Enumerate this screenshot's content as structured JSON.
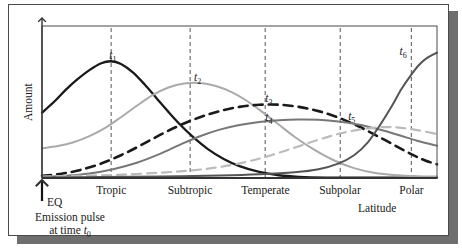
{
  "figure": {
    "y_axis_label": "Amount",
    "x_axis_label": "Latitude",
    "origin_marker": "EQ",
    "caption_line1": "Emission pulse",
    "caption_line2_prefix": "at time ",
    "caption_line2_symbol": "t",
    "caption_line2_subscript": "0"
  },
  "colors": {
    "t1": "#1a1a1a",
    "t2": "#aaaaaa",
    "t3": "#1a1a1a",
    "t4": "#777777",
    "t5": "#bbbbbb",
    "t6": "#555555",
    "axis": "#333333",
    "gridline": "#555555",
    "frame": "#4a4a4a",
    "shadow": "#6e6e6e",
    "background": "#ffffff"
  },
  "zones": [
    {
      "name": "Tropic",
      "x": 0.175
    },
    {
      "name": "Subtropic",
      "x": 0.375
    },
    {
      "name": "Temperate",
      "x": 0.565
    },
    {
      "name": "Subpolar",
      "x": 0.755
    },
    {
      "name": "Polar",
      "x": 0.935
    }
  ],
  "curve_labels": [
    {
      "id": "t1",
      "symbol": "t",
      "subscript": "1"
    },
    {
      "id": "t2",
      "symbol": "t",
      "subscript": "2"
    },
    {
      "id": "t3",
      "symbol": "t",
      "subscript": "3"
    },
    {
      "id": "t4",
      "symbol": "t",
      "subscript": "4"
    },
    {
      "id": "t5",
      "symbol": "t",
      "subscript": "5"
    },
    {
      "id": "t6",
      "symbol": "t",
      "subscript": "6"
    }
  ],
  "chart_data": {
    "type": "line",
    "title": "",
    "xlabel": "Latitude",
    "ylabel": "Amount",
    "xlim": [
      0,
      1
    ],
    "ylim": [
      0,
      1
    ],
    "grid": "vertical-dashed-at-zone-ticks",
    "legend": "inline-curve-labels",
    "x_tick_labels": [
      "Tropic",
      "Subtropic",
      "Temperate",
      "Subpolar",
      "Polar"
    ],
    "x_tick_positions": [
      0.175,
      0.375,
      0.565,
      0.755,
      0.935
    ],
    "y_tick_labels": [],
    "annotations": [
      {
        "text": "EQ",
        "x": 0.0,
        "y": 0.0
      },
      {
        "text": "Emission pulse at time t0",
        "x": 0.0,
        "y": -0.18
      }
    ],
    "series": [
      {
        "name": "t1",
        "style": "solid",
        "color": "#1a1a1a",
        "width": 2.3,
        "label_x": 0.165,
        "label_y": 0.8,
        "peak_x": 0.175,
        "points": [
          [
            0.0,
            0.43
          ],
          [
            0.03,
            0.5
          ],
          [
            0.06,
            0.58
          ],
          [
            0.09,
            0.65
          ],
          [
            0.12,
            0.71
          ],
          [
            0.15,
            0.755
          ],
          [
            0.175,
            0.768
          ],
          [
            0.2,
            0.75
          ],
          [
            0.23,
            0.695
          ],
          [
            0.26,
            0.615
          ],
          [
            0.29,
            0.525
          ],
          [
            0.32,
            0.435
          ],
          [
            0.35,
            0.35
          ],
          [
            0.38,
            0.275
          ],
          [
            0.42,
            0.19
          ],
          [
            0.46,
            0.125
          ],
          [
            0.5,
            0.078
          ],
          [
            0.55,
            0.04
          ],
          [
            0.6,
            0.018
          ],
          [
            0.65,
            0.008
          ],
          [
            0.72,
            0.003
          ],
          [
            0.8,
            0.002
          ],
          [
            0.9,
            0.002
          ],
          [
            1.0,
            0.002
          ]
        ]
      },
      {
        "name": "t2",
        "style": "solid",
        "color": "#aaaaaa",
        "width": 2.0,
        "label_x": 0.38,
        "label_y": 0.655,
        "peak_x": 0.375,
        "points": [
          [
            0.0,
            0.195
          ],
          [
            0.04,
            0.21
          ],
          [
            0.08,
            0.235
          ],
          [
            0.12,
            0.275
          ],
          [
            0.16,
            0.33
          ],
          [
            0.2,
            0.4
          ],
          [
            0.24,
            0.475
          ],
          [
            0.28,
            0.545
          ],
          [
            0.32,
            0.595
          ],
          [
            0.36,
            0.622
          ],
          [
            0.4,
            0.625
          ],
          [
            0.44,
            0.605
          ],
          [
            0.48,
            0.565
          ],
          [
            0.52,
            0.505
          ],
          [
            0.56,
            0.43
          ],
          [
            0.6,
            0.35
          ],
          [
            0.64,
            0.27
          ],
          [
            0.69,
            0.185
          ],
          [
            0.74,
            0.115
          ],
          [
            0.79,
            0.065
          ],
          [
            0.84,
            0.035
          ],
          [
            0.9,
            0.018
          ],
          [
            0.95,
            0.012
          ],
          [
            1.0,
            0.01
          ]
        ]
      },
      {
        "name": "t3",
        "style": "dashed",
        "color": "#1a1a1a",
        "width": 2.6,
        "label_x": 0.56,
        "label_y": 0.52,
        "peak_x": 0.565,
        "points": [
          [
            0.0,
            0.015
          ],
          [
            0.05,
            0.028
          ],
          [
            0.1,
            0.055
          ],
          [
            0.15,
            0.095
          ],
          [
            0.2,
            0.15
          ],
          [
            0.25,
            0.215
          ],
          [
            0.3,
            0.285
          ],
          [
            0.35,
            0.348
          ],
          [
            0.4,
            0.4
          ],
          [
            0.45,
            0.44
          ],
          [
            0.5,
            0.468
          ],
          [
            0.55,
            0.482
          ],
          [
            0.6,
            0.482
          ],
          [
            0.65,
            0.468
          ],
          [
            0.7,
            0.44
          ],
          [
            0.75,
            0.398
          ],
          [
            0.8,
            0.342
          ],
          [
            0.85,
            0.275
          ],
          [
            0.9,
            0.205
          ],
          [
            0.94,
            0.15
          ],
          [
            0.97,
            0.115
          ],
          [
            1.0,
            0.09
          ]
        ]
      },
      {
        "name": "t4",
        "style": "solid",
        "color": "#777777",
        "width": 2.0,
        "label_x": 0.56,
        "label_y": 0.395,
        "peak_x": 0.64,
        "points": [
          [
            0.0,
            0.008
          ],
          [
            0.06,
            0.015
          ],
          [
            0.12,
            0.03
          ],
          [
            0.18,
            0.058
          ],
          [
            0.24,
            0.1
          ],
          [
            0.3,
            0.16
          ],
          [
            0.35,
            0.22
          ],
          [
            0.4,
            0.275
          ],
          [
            0.45,
            0.318
          ],
          [
            0.5,
            0.348
          ],
          [
            0.55,
            0.368
          ],
          [
            0.6,
            0.38
          ],
          [
            0.65,
            0.385
          ],
          [
            0.7,
            0.383
          ],
          [
            0.75,
            0.372
          ],
          [
            0.8,
            0.352
          ],
          [
            0.85,
            0.322
          ],
          [
            0.9,
            0.285
          ],
          [
            0.95,
            0.245
          ],
          [
            1.0,
            0.212
          ]
        ]
      },
      {
        "name": "t5",
        "style": "dashed",
        "color": "#bbbbbb",
        "width": 2.2,
        "label_x": 0.77,
        "label_y": 0.4,
        "peak_x": 0.86,
        "points": [
          [
            0.0,
            0.01
          ],
          [
            0.1,
            0.015
          ],
          [
            0.2,
            0.022
          ],
          [
            0.3,
            0.035
          ],
          [
            0.38,
            0.05
          ],
          [
            0.45,
            0.072
          ],
          [
            0.52,
            0.108
          ],
          [
            0.58,
            0.15
          ],
          [
            0.64,
            0.2
          ],
          [
            0.7,
            0.252
          ],
          [
            0.76,
            0.296
          ],
          [
            0.82,
            0.325
          ],
          [
            0.87,
            0.335
          ],
          [
            0.91,
            0.33
          ],
          [
            0.95,
            0.315
          ],
          [
            1.0,
            0.29
          ]
        ]
      },
      {
        "name": "t6",
        "style": "solid",
        "color": "#555555",
        "width": 2.0,
        "label_x": 0.9,
        "label_y": 0.83,
        "peak_x": 1.0,
        "points": [
          [
            0.0,
            0.004
          ],
          [
            0.15,
            0.006
          ],
          [
            0.3,
            0.01
          ],
          [
            0.45,
            0.016
          ],
          [
            0.55,
            0.024
          ],
          [
            0.64,
            0.038
          ],
          [
            0.7,
            0.058
          ],
          [
            0.75,
            0.095
          ],
          [
            0.79,
            0.15
          ],
          [
            0.825,
            0.235
          ],
          [
            0.855,
            0.345
          ],
          [
            0.885,
            0.47
          ],
          [
            0.91,
            0.585
          ],
          [
            0.935,
            0.68
          ],
          [
            0.955,
            0.745
          ],
          [
            0.975,
            0.79
          ],
          [
            1.0,
            0.825
          ]
        ]
      }
    ]
  }
}
